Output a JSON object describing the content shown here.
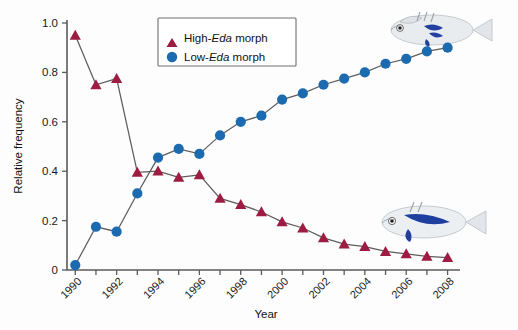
{
  "figure": {
    "background_color": "#fdfdfd"
  },
  "axes": {
    "ylabel": "Relative frequency",
    "xlabel": "Year",
    "y_ticks": [
      "0",
      "0.2",
      "0.4",
      "0.6",
      "0.8",
      "1.0"
    ],
    "y_tick_values": [
      0,
      0.2,
      0.4,
      0.6,
      0.8,
      1.0
    ],
    "x_tick_labels": [
      "1990",
      "1992",
      "1994",
      "1996",
      "1998",
      "2000",
      "2002",
      "2004",
      "2006",
      "2008"
    ],
    "x_tick_years": [
      1990,
      1992,
      1994,
      1996,
      1998,
      2000,
      2002,
      2004,
      2006,
      2008
    ],
    "x_minor_years": [
      1990,
      1991,
      1992,
      1993,
      1994,
      1995,
      1996,
      1997,
      1998,
      1999,
      2000,
      2001,
      2002,
      2003,
      2004,
      2005,
      2006,
      2007,
      2008
    ]
  },
  "legend": {
    "entries": [
      {
        "prefix": "High-",
        "em": "Eda",
        "suffix": " morph",
        "marker": "triangle",
        "color": "#9E1C42"
      },
      {
        "prefix": "Low-",
        "em": "Eda",
        "suffix": " morph",
        "marker": "circle",
        "color": "#1C6BB0"
      }
    ]
  },
  "illustrations": [
    {
      "name": "stickleback-high-eda",
      "caption": ""
    },
    {
      "name": "stickleback-low-eda",
      "caption": ""
    }
  ],
  "chart_data": {
    "type": "line",
    "title": "",
    "xlabel": "Year",
    "ylabel": "Relative frequency",
    "xlim": [
      1989.6,
      2008.6
    ],
    "ylim": [
      0,
      1.0
    ],
    "grid": false,
    "legend_position": "top-center",
    "x": [
      1990,
      1991,
      1992,
      1993,
      1994,
      1995,
      1996,
      1997,
      1998,
      1999,
      2000,
      2001,
      2002,
      2003,
      2004,
      2005,
      2006,
      2007,
      2008
    ],
    "series": [
      {
        "name": "High-Eda morph",
        "marker": "triangle",
        "color": "#9E1C42",
        "values": [
          0.95,
          0.75,
          0.775,
          0.395,
          0.4,
          0.375,
          0.385,
          0.29,
          0.265,
          0.235,
          0.195,
          0.17,
          0.13,
          0.105,
          0.095,
          0.075,
          0.065,
          0.055,
          0.05
        ]
      },
      {
        "name": "Low-Eda morph",
        "marker": "circle",
        "color": "#1C6BB0",
        "values": [
          0.02,
          0.175,
          0.155,
          0.31,
          0.455,
          0.49,
          0.47,
          0.545,
          0.6,
          0.625,
          0.69,
          0.715,
          0.75,
          0.775,
          0.8,
          0.835,
          0.855,
          0.885,
          0.9
        ]
      }
    ]
  }
}
